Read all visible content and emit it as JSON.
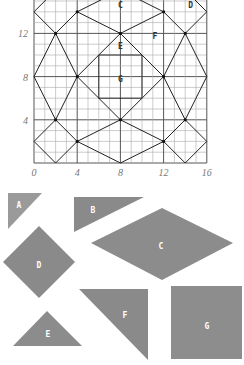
{
  "grid": {
    "x_ticks": [
      "0",
      "4",
      "8",
      "12",
      "16"
    ],
    "y_ticks": [
      "4",
      "8",
      "12"
    ],
    "x_tick_values": [
      0,
      4,
      8,
      12,
      16
    ],
    "y_tick_values": [
      4,
      8,
      12
    ],
    "range": [
      0,
      16
    ],
    "region_labels": [
      {
        "text": "C",
        "u": 8,
        "v": 14.6
      },
      {
        "text": "D",
        "u": 14.5,
        "v": 14.6
      },
      {
        "text": "F",
        "u": 11.2,
        "v": 11.8
      },
      {
        "text": "E",
        "u": 8,
        "v": 10.8
      },
      {
        "text": "G",
        "u": 8,
        "v": 7.8
      }
    ],
    "segments": [
      [
        [
          0,
          2
        ],
        [
          2,
          0
        ]
      ],
      [
        [
          2,
          0
        ],
        [
          4,
          2
        ]
      ],
      [
        [
          4,
          2
        ],
        [
          2,
          4
        ]
      ],
      [
        [
          2,
          4
        ],
        [
          0,
          2
        ]
      ],
      [
        [
          12,
          2
        ],
        [
          14,
          0
        ]
      ],
      [
        [
          14,
          0
        ],
        [
          16,
          2
        ]
      ],
      [
        [
          16,
          2
        ],
        [
          14,
          4
        ]
      ],
      [
        [
          14,
          4
        ],
        [
          12,
          2
        ]
      ],
      [
        [
          4,
          2
        ],
        [
          8,
          0
        ]
      ],
      [
        [
          8,
          0
        ],
        [
          12,
          2
        ]
      ],
      [
        [
          12,
          2
        ],
        [
          8,
          4
        ]
      ],
      [
        [
          8,
          4
        ],
        [
          4,
          2
        ]
      ],
      [
        [
          0,
          8
        ],
        [
          2,
          4
        ]
      ],
      [
        [
          2,
          4
        ],
        [
          4,
          8
        ]
      ],
      [
        [
          4,
          8
        ],
        [
          2,
          12
        ]
      ],
      [
        [
          2,
          12
        ],
        [
          0,
          8
        ]
      ],
      [
        [
          16,
          8
        ],
        [
          14,
          4
        ]
      ],
      [
        [
          14,
          4
        ],
        [
          12,
          8
        ]
      ],
      [
        [
          12,
          8
        ],
        [
          14,
          12
        ]
      ],
      [
        [
          14,
          12
        ],
        [
          16,
          8
        ]
      ],
      [
        [
          4,
          8
        ],
        [
          8,
          4
        ]
      ],
      [
        [
          8,
          4
        ],
        [
          12,
          8
        ]
      ],
      [
        [
          12,
          8
        ],
        [
          8,
          12
        ]
      ],
      [
        [
          8,
          12
        ],
        [
          4,
          8
        ]
      ],
      [
        [
          2,
          12
        ],
        [
          4,
          14
        ]
      ],
      [
        [
          14,
          12
        ],
        [
          12,
          14
        ]
      ],
      [
        [
          4,
          14
        ],
        [
          8,
          12
        ]
      ],
      [
        [
          8,
          12
        ],
        [
          12,
          14
        ]
      ],
      [
        [
          0,
          14
        ],
        [
          2,
          12
        ]
      ],
      [
        [
          16,
          14
        ],
        [
          14,
          12
        ]
      ],
      [
        [
          0,
          14
        ],
        [
          2,
          16
        ]
      ],
      [
        [
          16,
          14
        ],
        [
          14,
          16
        ]
      ],
      [
        [
          4,
          14
        ],
        [
          8,
          16
        ]
      ],
      [
        [
          12,
          14
        ],
        [
          8,
          16
        ]
      ],
      [
        [
          6,
          6
        ],
        [
          10,
          6
        ]
      ],
      [
        [
          10,
          6
        ],
        [
          10,
          10
        ]
      ],
      [
        [
          10,
          10
        ],
        [
          6,
          10
        ]
      ],
      [
        [
          6,
          10
        ],
        [
          6,
          6
        ]
      ]
    ],
    "vertices": [
      [
        2,
        12
      ],
      [
        4,
        14
      ],
      [
        8,
        12
      ],
      [
        12,
        14
      ],
      [
        14,
        12
      ],
      [
        4,
        8
      ],
      [
        12,
        8
      ],
      [
        2,
        4
      ],
      [
        4,
        2
      ],
      [
        8,
        4
      ],
      [
        12,
        2
      ],
      [
        14,
        4
      ]
    ]
  },
  "pieces": [
    {
      "name": "A",
      "points": [
        [
          8,
          193
        ],
        [
          42,
          193
        ],
        [
          8,
          229
        ]
      ],
      "label_at": [
        19,
        205
      ],
      "color": "#9a9a9a"
    },
    {
      "name": "B",
      "points": [
        [
          74,
          197
        ],
        [
          144,
          197
        ],
        [
          74,
          232
        ]
      ],
      "label_at": [
        93,
        210
      ],
      "color": "#8a8a8a"
    },
    {
      "name": "C",
      "points": [
        [
          91,
          243
        ],
        [
          162,
          208
        ],
        [
          233,
          243
        ],
        [
          162,
          280
        ]
      ],
      "label_at": [
        161,
        246
      ],
      "color": "#8c8c8c"
    },
    {
      "name": "D",
      "points": [
        [
          39,
          226
        ],
        [
          75,
          262
        ],
        [
          39,
          298
        ],
        [
          3,
          262
        ]
      ],
      "label_at": [
        39,
        265
      ],
      "color": "#8a8a8a"
    },
    {
      "name": "E",
      "points": [
        [
          47,
          311
        ],
        [
          82,
          346
        ],
        [
          13,
          346
        ]
      ],
      "label_at": [
        48,
        334
      ],
      "color": "#8c8c8c"
    },
    {
      "name": "F",
      "points": [
        [
          79,
          289
        ],
        [
          148,
          289
        ],
        [
          148,
          360
        ]
      ],
      "label_at": [
        125,
        315
      ],
      "color": "#8a8a8a"
    },
    {
      "name": "G",
      "points": [
        [
          171,
          286
        ],
        [
          242,
          286
        ],
        [
          242,
          359
        ],
        [
          171,
          359
        ]
      ],
      "label_at": [
        207,
        326
      ],
      "color": "#8d8d8d"
    }
  ]
}
